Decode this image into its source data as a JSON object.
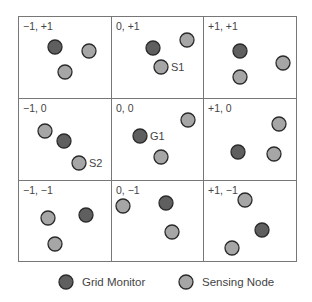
{
  "colors": {
    "grid_monitor_fill": "#5f5f5f",
    "sensing_node_fill": "#a6a6a6",
    "circle_stroke": "#2a2a2a",
    "grid_stroke": "#777777",
    "text": "#444444"
  },
  "grid": {
    "cells": [
      {
        "label": "−1, +1",
        "row": 0,
        "col": 0,
        "nodes": [
          {
            "type": "monitor",
            "x": 55,
            "y": 47
          },
          {
            "type": "sensor",
            "x": 89,
            "y": 51
          },
          {
            "type": "sensor",
            "x": 65,
            "y": 72
          }
        ]
      },
      {
        "label": "0, +1",
        "row": 0,
        "col": 1,
        "nodes": [
          {
            "type": "monitor",
            "x": 153,
            "y": 48
          },
          {
            "type": "sensor",
            "x": 187,
            "y": 40
          },
          {
            "type": "sensor",
            "x": 161,
            "y": 67,
            "label": "S1"
          }
        ]
      },
      {
        "label": "+1, +1",
        "row": 0,
        "col": 2,
        "nodes": [
          {
            "type": "monitor",
            "x": 240,
            "y": 51
          },
          {
            "type": "sensor",
            "x": 283,
            "y": 63
          },
          {
            "type": "sensor",
            "x": 240,
            "y": 77
          }
        ]
      },
      {
        "label": "−1, 0",
        "row": 1,
        "col": 0,
        "nodes": [
          {
            "type": "sensor",
            "x": 45,
            "y": 131
          },
          {
            "type": "monitor",
            "x": 64,
            "y": 141
          },
          {
            "type": "sensor",
            "x": 79,
            "y": 163,
            "label": "S2"
          }
        ]
      },
      {
        "label": "0, 0",
        "row": 1,
        "col": 1,
        "nodes": [
          {
            "type": "monitor",
            "x": 140,
            "y": 136,
            "label": "G1"
          },
          {
            "type": "sensor",
            "x": 188,
            "y": 120
          },
          {
            "type": "sensor",
            "x": 161,
            "y": 157
          }
        ]
      },
      {
        "label": "+1, 0",
        "row": 1,
        "col": 2,
        "nodes": [
          {
            "type": "sensor",
            "x": 279,
            "y": 124
          },
          {
            "type": "monitor",
            "x": 238,
            "y": 152
          },
          {
            "type": "sensor",
            "x": 274,
            "y": 154
          }
        ]
      },
      {
        "label": "−1, −1",
        "row": 2,
        "col": 0,
        "nodes": [
          {
            "type": "sensor",
            "x": 48,
            "y": 218
          },
          {
            "type": "monitor",
            "x": 86,
            "y": 215
          },
          {
            "type": "sensor",
            "x": 55,
            "y": 244
          }
        ]
      },
      {
        "label": "0, −1",
        "row": 2,
        "col": 1,
        "nodes": [
          {
            "type": "sensor",
            "x": 123,
            "y": 206
          },
          {
            "type": "monitor",
            "x": 166,
            "y": 203
          },
          {
            "type": "sensor",
            "x": 172,
            "y": 232
          }
        ]
      },
      {
        "label": "+1, −1",
        "row": 2,
        "col": 2,
        "nodes": [
          {
            "type": "sensor",
            "x": 245,
            "y": 200
          },
          {
            "type": "monitor",
            "x": 262,
            "y": 230
          },
          {
            "type": "sensor",
            "x": 232,
            "y": 248
          }
        ]
      }
    ]
  },
  "legend": {
    "items": [
      {
        "type": "monitor",
        "label": "Grid Monitor"
      },
      {
        "type": "sensor",
        "label": "Sensing Node"
      }
    ]
  }
}
